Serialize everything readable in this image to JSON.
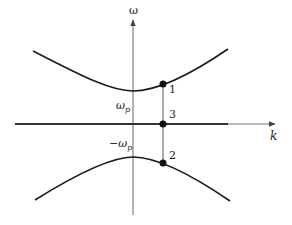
{
  "diagram": {
    "axes": {
      "x_label": "k",
      "y_label": "ω"
    },
    "levels": {
      "upper_label": "ω",
      "upper_sub": "p",
      "lower_label": "−ω",
      "lower_sub": "p"
    },
    "points": [
      {
        "id": "1",
        "label": "1",
        "branch": "upper"
      },
      {
        "id": "3",
        "label": "3",
        "branch": "axis"
      },
      {
        "id": "2",
        "label": "2",
        "branch": "lower"
      }
    ],
    "colors": {
      "curve": "#1a1a1a",
      "axis": "#555555",
      "point": "#111111"
    }
  }
}
